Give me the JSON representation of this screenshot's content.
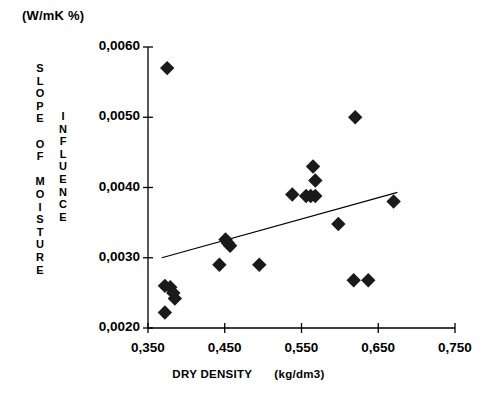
{
  "unit_label": "(W/mK %)",
  "y_axis": {
    "title_primary": "SLOPE OF MOISTURE",
    "title_secondary": "INFLUENCE",
    "ticks": [
      "0,0060",
      "0,0050",
      "0,0040",
      "0,0030",
      "0,0020"
    ]
  },
  "x_axis": {
    "caption_name": "DRY DENSITY",
    "caption_unit": "(kg/dm3)",
    "ticks": [
      "0,350",
      "0,450",
      "0,550",
      "0,650",
      "0,750"
    ]
  },
  "colors": {
    "marker": "#1a1a1a",
    "axis": "#000000",
    "trendline": "#000000",
    "background": "#ffffff"
  },
  "chart_data": {
    "type": "scatter",
    "title": "",
    "xlabel": "DRY DENSITY  (kg/dm3)",
    "ylabel": "SLOPE OF MOISTURE INFLUENCE (W/mK %)",
    "xlim": [
      0.35,
      0.75
    ],
    "ylim": [
      0.002,
      0.006
    ],
    "xticks": [
      0.35,
      0.45,
      0.55,
      0.65,
      0.75
    ],
    "yticks": [
      0.002,
      0.003,
      0.004,
      0.005,
      0.006
    ],
    "grid": false,
    "legend": "none",
    "marker_shape": "filled-diamond",
    "points": [
      {
        "x": 0.375,
        "y": 0.0057
      },
      {
        "x": 0.372,
        "y": 0.0026
      },
      {
        "x": 0.379,
        "y": 0.00258
      },
      {
        "x": 0.383,
        "y": 0.0025
      },
      {
        "x": 0.385,
        "y": 0.00242
      },
      {
        "x": 0.372,
        "y": 0.00222
      },
      {
        "x": 0.443,
        "y": 0.0029
      },
      {
        "x": 0.451,
        "y": 0.00326
      },
      {
        "x": 0.454,
        "y": 0.00321
      },
      {
        "x": 0.457,
        "y": 0.00317
      },
      {
        "x": 0.495,
        "y": 0.0029
      },
      {
        "x": 0.538,
        "y": 0.0039
      },
      {
        "x": 0.556,
        "y": 0.00388
      },
      {
        "x": 0.562,
        "y": 0.00388
      },
      {
        "x": 0.568,
        "y": 0.00388
      },
      {
        "x": 0.565,
        "y": 0.0043
      },
      {
        "x": 0.568,
        "y": 0.0041
      },
      {
        "x": 0.598,
        "y": 0.00348
      },
      {
        "x": 0.62,
        "y": 0.005
      },
      {
        "x": 0.618,
        "y": 0.00268
      },
      {
        "x": 0.637,
        "y": 0.00268
      },
      {
        "x": 0.67,
        "y": 0.0038
      }
    ],
    "trendline": {
      "x_start": 0.368,
      "y_start": 0.003,
      "x_end": 0.675,
      "y_end": 0.00393
    }
  }
}
